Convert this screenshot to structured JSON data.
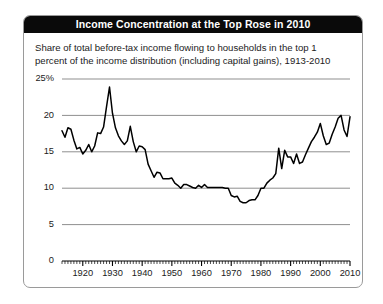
{
  "figure": {
    "title": "Income Concentration at the Top Rose in 2010",
    "subtitle": "Share of total before-tax income flowing to households in the top 1 percent of the income distribution (including capital gains), 1913-2010",
    "title_background": "#0a0a0a",
    "title_color": "#ffffff",
    "line_color": "#000000",
    "grid_color": "#8f8f8f",
    "border_color": "#9a9a9a"
  },
  "chart_data": {
    "type": "line",
    "title": "Income Concentration at the Top Rose in 2010",
    "subtitle": "Share of total before-tax income flowing to households in the top 1 percent of the income distribution (including capital gains), 1913-2010",
    "xlabel": "",
    "ylabel": "",
    "xlim": [
      1913,
      2010
    ],
    "ylim": [
      0,
      25
    ],
    "grid": true,
    "legend": false,
    "ytick_labels": [
      "25%",
      "20",
      "15",
      "10",
      "5",
      "0"
    ],
    "yticks": [
      25,
      20,
      15,
      10,
      5,
      0
    ],
    "xtick_labels": [
      "1920",
      "1930",
      "1940",
      "1950",
      "1960",
      "1970",
      "1980",
      "1990",
      "2000",
      "2010"
    ],
    "xticks": [
      1920,
      1930,
      1940,
      1950,
      1960,
      1970,
      1980,
      1990,
      2000,
      2010
    ],
    "minor_xtick_interval": 1,
    "series": [
      {
        "name": "Top 1 percent income share",
        "x": [
          1913,
          1914,
          1915,
          1916,
          1917,
          1918,
          1919,
          1920,
          1921,
          1922,
          1923,
          1924,
          1925,
          1926,
          1927,
          1928,
          1929,
          1930,
          1931,
          1932,
          1933,
          1934,
          1935,
          1936,
          1937,
          1938,
          1939,
          1940,
          1941,
          1942,
          1943,
          1944,
          1945,
          1946,
          1947,
          1948,
          1949,
          1950,
          1951,
          1952,
          1953,
          1954,
          1955,
          1956,
          1957,
          1958,
          1959,
          1960,
          1961,
          1962,
          1963,
          1964,
          1965,
          1966,
          1967,
          1968,
          1969,
          1970,
          1971,
          1972,
          1973,
          1974,
          1975,
          1976,
          1977,
          1978,
          1979,
          1980,
          1981,
          1982,
          1983,
          1984,
          1985,
          1986,
          1987,
          1988,
          1989,
          1990,
          1991,
          1992,
          1993,
          1994,
          1995,
          1996,
          1997,
          1998,
          1999,
          2000,
          2001,
          2002,
          2003,
          2004,
          2005,
          2006,
          2007,
          2008,
          2009,
          2010
        ],
        "values": [
          17.9,
          17.0,
          18.3,
          18.1,
          16.6,
          15.4,
          15.6,
          14.7,
          15.2,
          16.0,
          15.0,
          15.8,
          17.6,
          17.5,
          18.4,
          21.2,
          23.9,
          20.3,
          18.3,
          17.2,
          16.5,
          16.0,
          16.5,
          18.5,
          16.4,
          15.0,
          15.8,
          15.7,
          15.3,
          13.3,
          12.4,
          11.5,
          12.2,
          12.1,
          11.3,
          11.3,
          11.3,
          11.4,
          10.7,
          10.4,
          10.0,
          10.5,
          10.5,
          10.3,
          10.1,
          10.0,
          10.4,
          10.1,
          10.5,
          10.1,
          10.1,
          10.1,
          10.1,
          10.1,
          10.1,
          10.0,
          10.0,
          9.0,
          8.8,
          8.9,
          8.2,
          8.0,
          8.0,
          8.3,
          8.4,
          8.4,
          9.0,
          10.0,
          10.0,
          10.7,
          11.1,
          11.4,
          12.0,
          15.5,
          12.7,
          15.2,
          14.3,
          14.3,
          13.4,
          14.7,
          13.4,
          13.6,
          14.6,
          15.5,
          16.4,
          17.0,
          17.7,
          18.9,
          17.2,
          16.0,
          16.2,
          17.4,
          18.4,
          19.6,
          20.0,
          18.0,
          17.1,
          19.8
        ]
      }
    ]
  }
}
